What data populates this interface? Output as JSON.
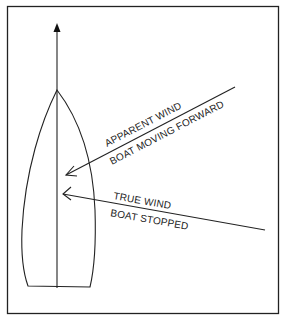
{
  "diagram": {
    "title": "",
    "labels": {
      "apparent_wind": "APPARENT WIND",
      "boat_moving_forward": "BOAT MOVING FORWARD",
      "true_wind": "TRUE WIND",
      "boat_stopped": "BOAT STOPPED"
    },
    "colors": {
      "line": "#222222",
      "background": "#ffffff"
    }
  }
}
